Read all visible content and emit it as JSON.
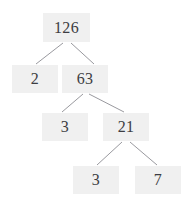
{
  "figure": {
    "kind": "factor-tree",
    "width": 185,
    "height": 202,
    "background_color": "#ffffff",
    "node_fill_color": "#f0f0f0",
    "node_text_color": "#3d3d42",
    "edge_color": "#8d8d93"
  },
  "nodes": [
    {
      "id": "n126",
      "label": "126",
      "x": 43,
      "y": 13,
      "w": 47,
      "h": 29,
      "level": 0
    },
    {
      "id": "n2",
      "label": "2",
      "x": 12,
      "y": 65,
      "w": 46,
      "h": 28,
      "level": 1
    },
    {
      "id": "n63",
      "label": "63",
      "x": 62,
      "y": 65,
      "w": 46,
      "h": 28,
      "level": 1
    },
    {
      "id": "n3a",
      "label": "3",
      "x": 42,
      "y": 113,
      "w": 46,
      "h": 28,
      "level": 2
    },
    {
      "id": "n21",
      "label": "21",
      "x": 103,
      "y": 113,
      "w": 46,
      "h": 28,
      "level": 2
    },
    {
      "id": "n3b",
      "label": "3",
      "x": 73,
      "y": 166,
      "w": 46,
      "h": 28,
      "level": 3
    },
    {
      "id": "n7",
      "label": "7",
      "x": 135,
      "y": 166,
      "w": 46,
      "h": 28,
      "level": 3
    }
  ],
  "edges": [
    {
      "id": "e126-2",
      "from": "n126",
      "to": "n2",
      "x1": 63,
      "y1": 43,
      "x2": 36,
      "y2": 64
    },
    {
      "id": "e126-63",
      "from": "n126",
      "to": "n63",
      "x1": 71,
      "y1": 43,
      "x2": 94,
      "y2": 64
    },
    {
      "id": "e63-3",
      "from": "n63",
      "to": "n3a",
      "x1": 83,
      "y1": 94,
      "x2": 62,
      "y2": 112
    },
    {
      "id": "e63-21",
      "from": "n63",
      "to": "n21",
      "x1": 89,
      "y1": 94,
      "x2": 124,
      "y2": 112
    },
    {
      "id": "e21-3",
      "from": "n21",
      "to": "n3b",
      "x1": 122,
      "y1": 142,
      "x2": 97,
      "y2": 165
    },
    {
      "id": "e21-7",
      "from": "n21",
      "to": "n7",
      "x1": 130,
      "y1": 142,
      "x2": 157,
      "y2": 165
    }
  ]
}
